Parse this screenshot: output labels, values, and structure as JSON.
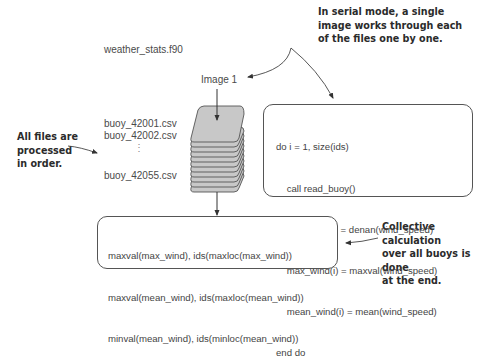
{
  "program_file": "weather_stats.f90",
  "image_label": "Image 1",
  "files": {
    "first": "buoy_42001.csv",
    "second": "buoy_42002.csv",
    "ellipsis": "⋮",
    "last": "buoy_42055.csv"
  },
  "annotations": {
    "serial_mode": [
      "In serial mode, a single",
      "image works through each",
      "of the files one by one."
    ],
    "files_in_order": [
      "All files are",
      "processed",
      "in order."
    ],
    "collective": [
      "Collective calculation",
      "over all buoys is done",
      "at the end."
    ]
  },
  "loop_code": [
    "do i = 1, size(ids)",
    "    call read_buoy()",
    "    wind_speed = denan(wind_speed)",
    "    max_wind(i) = maxval(wind_speed)",
    "    mean_wind(i) = mean(wind_speed)",
    "end do"
  ],
  "final_code": [
    "maxval(max_wind), ids(maxloc(max_wind))",
    "maxval(mean_wind), ids(maxloc(mean_wind))",
    "minval(mean_wind), ids(minloc(mean_wind))"
  ],
  "colors": {
    "stack_fill": "#c8c8c8",
    "stack_stroke": "#555555",
    "box_stroke": "#555555",
    "text": "#444444",
    "note_text": "#2b2b2b"
  }
}
